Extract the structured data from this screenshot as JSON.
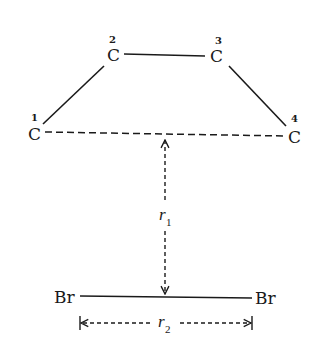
{
  "diagram": {
    "type": "molecular-geometry",
    "atoms": [
      {
        "id": "C1",
        "symbol": "C",
        "number": "1"
      },
      {
        "id": "C2",
        "symbol": "C",
        "number": "2"
      },
      {
        "id": "C3",
        "symbol": "C",
        "number": "3"
      },
      {
        "id": "C4",
        "symbol": "C",
        "number": "4"
      },
      {
        "id": "Br_left",
        "symbol": "Br"
      },
      {
        "id": "Br_right",
        "symbol": "Br"
      }
    ],
    "bonds": [
      {
        "from": "C1",
        "to": "C2",
        "style": "solid"
      },
      {
        "from": "C2",
        "to": "C3",
        "style": "solid"
      },
      {
        "from": "C3",
        "to": "C4",
        "style": "solid"
      },
      {
        "from": "C1",
        "to": "C4",
        "style": "dashed"
      },
      {
        "from": "Br_left",
        "to": "Br_right",
        "style": "solid"
      }
    ],
    "distances": [
      {
        "id": "r1",
        "symbol": "r",
        "subscript": "1",
        "description": "perpendicular distance from C1–C4 line to Br–Br bond"
      },
      {
        "id": "r2",
        "symbol": "r",
        "subscript": "2",
        "description": "Br–Br bond length"
      }
    ],
    "colors": {
      "ink": "#1a1a1a",
      "background": "#ffffff"
    }
  }
}
